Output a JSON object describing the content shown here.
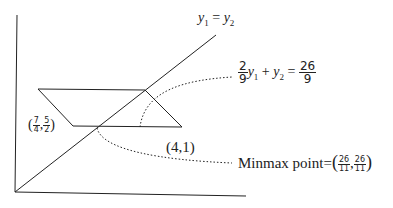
{
  "diagram": {
    "line_label": {
      "lhs": "y",
      "lhs_sub": "1",
      "eq": "=",
      "rhs": "y",
      "rhs_sub": "2"
    },
    "constraint_label": {
      "coef_num": "2",
      "coef_den": "9",
      "var1": "y",
      "var1_sub": "1",
      "plus": "+",
      "var2": "y",
      "var2_sub": "2",
      "eq": "=",
      "rhs_num": "26",
      "rhs_den": "9"
    },
    "point_left": {
      "open": "(",
      "x_num": "7",
      "x_den": "4",
      "comma": ",",
      "y_num": "5",
      "y_den": "2",
      "close": ")"
    },
    "point_right": {
      "text": "(4,1)"
    },
    "minmax": {
      "prefix": "Minmax point=",
      "open": "(",
      "x_num": "26",
      "x_den": "11",
      "comma": ",",
      "y_num": "26",
      "y_den": "11",
      "close": ")"
    },
    "colors": {
      "stroke": "#222222",
      "background": "#ffffff"
    }
  }
}
